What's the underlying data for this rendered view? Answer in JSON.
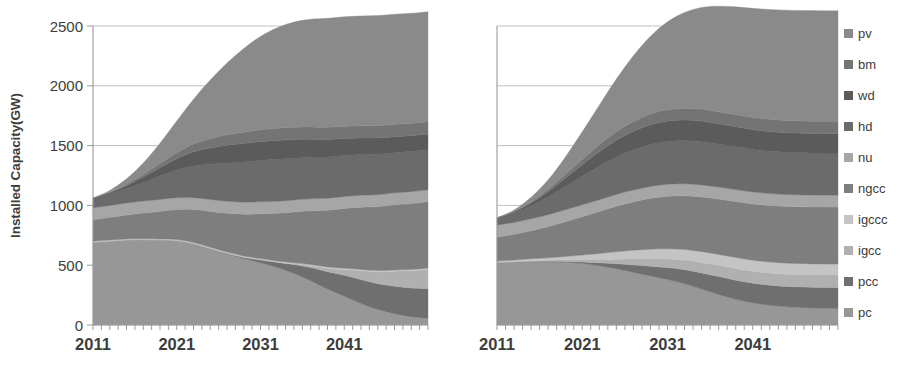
{
  "figure": {
    "ylabel": "Installed Capacity(GW)",
    "background": "#ffffff"
  },
  "legend": {
    "position": "right",
    "items": [
      {
        "key": "pv",
        "label": "pv",
        "color": "#8a8a8a"
      },
      {
        "key": "bm",
        "label": "bm",
        "color": "#747474"
      },
      {
        "key": "wd",
        "label": "wd",
        "color": "#5b5b5b"
      },
      {
        "key": "hd",
        "label": "hd",
        "color": "#6b6b6b"
      },
      {
        "key": "nu",
        "label": "nu",
        "color": "#a6a6a6"
      },
      {
        "key": "ngcc",
        "label": "ngcc",
        "color": "#7e7e7e"
      },
      {
        "key": "igccc",
        "label": "igccc",
        "color": "#c4c4c4"
      },
      {
        "key": "igcc",
        "label": "igcc",
        "color": "#b0b0b0"
      },
      {
        "key": "pcc",
        "label": "pcc",
        "color": "#6f6f6f"
      },
      {
        "key": "pc",
        "label": "pc",
        "color": "#979797"
      }
    ]
  },
  "chart_data": [
    {
      "id": "left-chart",
      "type": "area",
      "stacked": true,
      "title": "",
      "xlabel": "",
      "ylabel": "Installed Capacity(GW)",
      "xlim": [
        2011,
        2051
      ],
      "ylim": [
        0,
        2500
      ],
      "yticks": [
        0,
        500,
        1000,
        1500,
        2000,
        2500
      ],
      "xticks": [
        2011,
        2021,
        2031,
        2041
      ],
      "xtick_labels": [
        "2011",
        "2021",
        "2031",
        "2041"
      ],
      "grid": true,
      "minor_tick_interval": 1,
      "x": [
        2011,
        2013,
        2015,
        2017,
        2019,
        2021,
        2023,
        2025,
        2027,
        2029,
        2031,
        2033,
        2035,
        2037,
        2039,
        2041,
        2043,
        2045,
        2047,
        2049,
        2051
      ],
      "series": [
        {
          "name": "pc",
          "values": [
            690,
            700,
            710,
            712,
            710,
            705,
            680,
            640,
            595,
            555,
            520,
            480,
            430,
            370,
            300,
            240,
            180,
            130,
            95,
            70,
            55
          ]
        },
        {
          "name": "pcc",
          "values": [
            0,
            0,
            0,
            0,
            0,
            0,
            0,
            0,
            5,
            12,
            25,
            45,
            75,
            110,
            145,
            175,
            200,
            215,
            230,
            240,
            250
          ]
        },
        {
          "name": "igcc",
          "values": [
            0,
            0,
            0,
            0,
            0,
            0,
            0,
            0,
            0,
            0,
            0,
            0,
            5,
            15,
            30,
            50,
            75,
            100,
            125,
            145,
            160
          ]
        },
        {
          "name": "igccc",
          "values": [
            10,
            10,
            10,
            10,
            10,
            10,
            10,
            10,
            10,
            10,
            10,
            10,
            10,
            10,
            10,
            10,
            10,
            10,
            10,
            10,
            10
          ]
        },
        {
          "name": "ngcc",
          "values": [
            180,
            190,
            200,
            215,
            230,
            250,
            275,
            300,
            325,
            350,
            375,
            400,
            425,
            450,
            475,
            500,
            520,
            535,
            545,
            550,
            555
          ]
        },
        {
          "name": "nu",
          "values": [
            100,
            100,
            100,
            100,
            100,
            100,
            100,
            100,
            100,
            100,
            100,
            100,
            100,
            100,
            100,
            100,
            100,
            100,
            100,
            100,
            100
          ]
        },
        {
          "name": "hd",
          "values": [
            80,
            95,
            120,
            155,
            195,
            230,
            265,
            295,
            320,
            335,
            345,
            350,
            350,
            348,
            345,
            342,
            340,
            338,
            336,
            335,
            335
          ]
        },
        {
          "name": "wd",
          "values": [
            0,
            10,
            25,
            45,
            70,
            95,
            118,
            135,
            148,
            155,
            158,
            158,
            155,
            150,
            146,
            142,
            138,
            136,
            134,
            133,
            132
          ]
        },
        {
          "name": "bm",
          "values": [
            0,
            5,
            12,
            22,
            35,
            50,
            65,
            78,
            88,
            95,
            100,
            102,
            103,
            103,
            103,
            103,
            103,
            103,
            103,
            103,
            103
          ]
        },
        {
          "name": "pv",
          "values": [
            0,
            15,
            45,
            95,
            170,
            265,
            375,
            490,
            600,
            700,
            780,
            840,
            880,
            900,
            910,
            915,
            918,
            920,
            920,
            920,
            920
          ]
        }
      ],
      "total_2011": 1060,
      "total_2051": 2420
    },
    {
      "id": "right-chart",
      "type": "area",
      "stacked": true,
      "title": "",
      "xlabel": "",
      "ylabel": "",
      "xlim": [
        2011,
        2051
      ],
      "ylim": [
        0,
        2500
      ],
      "yticks": [
        0,
        500,
        1000,
        1500,
        2000,
        2500
      ],
      "xticks": [
        2011,
        2021,
        2031,
        2041
      ],
      "xtick_labels": [
        "2011",
        "2021",
        "2031",
        "2041"
      ],
      "grid": true,
      "minor_tick_interval": 1,
      "x": [
        2011,
        2013,
        2015,
        2017,
        2019,
        2021,
        2023,
        2025,
        2027,
        2029,
        2031,
        2033,
        2035,
        2037,
        2039,
        2041,
        2043,
        2045,
        2047,
        2049,
        2051
      ],
      "series": [
        {
          "name": "pc",
          "values": [
            520,
            525,
            530,
            530,
            525,
            515,
            495,
            470,
            440,
            410,
            380,
            345,
            300,
            255,
            215,
            185,
            165,
            152,
            145,
            140,
            138
          ]
        },
        {
          "name": "pcc",
          "values": [
            0,
            0,
            0,
            2,
            6,
            12,
            25,
            42,
            62,
            82,
            100,
            118,
            135,
            150,
            160,
            165,
            168,
            170,
            172,
            173,
            174
          ]
        },
        {
          "name": "igcc",
          "values": [
            5,
            6,
            8,
            10,
            14,
            20,
            28,
            38,
            50,
            62,
            72,
            80,
            88,
            94,
            98,
            100,
            102,
            103,
            104,
            105,
            105
          ]
        },
        {
          "name": "igccc",
          "values": [
            10,
            12,
            15,
            20,
            28,
            38,
            50,
            62,
            72,
            80,
            85,
            88,
            90,
            91,
            92,
            92,
            92,
            92,
            92,
            92,
            92
          ]
        },
        {
          "name": "ngcc",
          "values": [
            200,
            215,
            235,
            260,
            290,
            320,
            350,
            380,
            405,
            425,
            440,
            450,
            458,
            463,
            467,
            470,
            472,
            474,
            475,
            476,
            476
          ]
        },
        {
          "name": "nu",
          "values": [
            100,
            100,
            100,
            100,
            100,
            100,
            100,
            100,
            100,
            100,
            100,
            100,
            100,
            100,
            100,
            100,
            100,
            100,
            100,
            100,
            100
          ]
        },
        {
          "name": "hd",
          "values": [
            60,
            80,
            110,
            150,
            195,
            240,
            280,
            312,
            335,
            350,
            358,
            362,
            362,
            360,
            358,
            356,
            354,
            353,
            352,
            352,
            352
          ]
        },
        {
          "name": "wd",
          "values": [
            0,
            8,
            22,
            42,
            68,
            95,
            120,
            140,
            155,
            165,
            170,
            172,
            172,
            170,
            168,
            166,
            165,
            164,
            163,
            163,
            163
          ]
        },
        {
          "name": "bm",
          "values": [
            0,
            4,
            10,
            20,
            32,
            46,
            60,
            72,
            82,
            90,
            95,
            98,
            100,
            101,
            102,
            102,
            102,
            102,
            102,
            102,
            102
          ]
        },
        {
          "name": "pv",
          "values": [
            0,
            12,
            38,
            80,
            145,
            230,
            330,
            440,
            550,
            650,
            735,
            800,
            850,
            882,
            900,
            912,
            918,
            922,
            924,
            925,
            925
          ]
        }
      ],
      "total_2011": 895,
      "total_2051": 2627
    }
  ]
}
